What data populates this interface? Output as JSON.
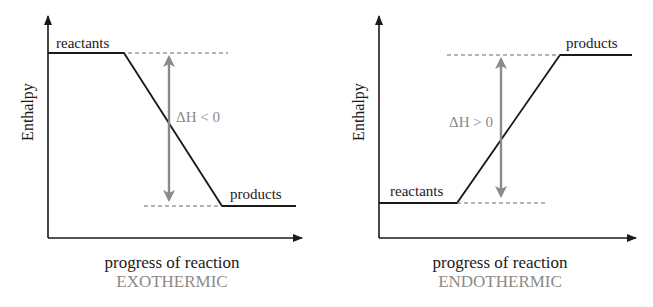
{
  "colors": {
    "line": "#1a1a1a",
    "accent": "#8a8a8a",
    "dashed": "#666666"
  },
  "panels": [
    {
      "type": "exothermic",
      "y_axis_label": "Enthalpy",
      "x_axis_label": "progress of reaction",
      "caption": "EXOTHERMIC",
      "reactants_label": "reactants",
      "products_label": "products",
      "delta_label": "ΔH < 0"
    },
    {
      "type": "endothermic",
      "y_axis_label": "Enthalpy",
      "x_axis_label": "progress of reaction",
      "caption": "ENDOTHERMIC",
      "reactants_label": "reactants",
      "products_label": "products",
      "delta_label": "ΔH > 0"
    }
  ]
}
